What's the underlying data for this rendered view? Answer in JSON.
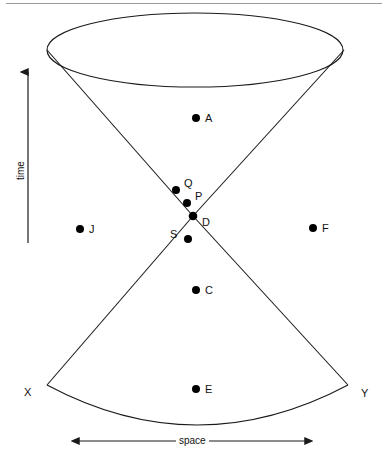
{
  "figure": {
    "background_color": "#ffffff",
    "line_color": "#1a1a1a",
    "dot_color": "#000000",
    "top_rule": true
  },
  "axes": {
    "time": {
      "label": "time",
      "direction": "up",
      "x": 28,
      "y_start": 243,
      "y_end": 70
    },
    "space": {
      "label": "space",
      "direction": "both",
      "y": 441,
      "x_start": 77,
      "x_end": 307
    }
  },
  "cone": {
    "apex": {
      "x": 193,
      "y": 216
    },
    "top_ellipse": {
      "cx": 195,
      "cy": 50,
      "rx": 148,
      "ry": 37
    },
    "bottom_arc": {
      "left_x": 47,
      "right_x": 348,
      "y": 385,
      "sag_y": 425
    },
    "left_top_x": 47,
    "right_top_x": 344
  },
  "corner_labels": [
    {
      "name": "X",
      "text": "X",
      "x": 24,
      "y": 387
    },
    {
      "name": "Y",
      "text": "Y",
      "x": 361,
      "y": 388
    }
  ],
  "events": [
    {
      "name": "A",
      "label": "A",
      "dot_x": 196,
      "dot_y": 118,
      "label_x": 205,
      "label_y": 113,
      "r": 4
    },
    {
      "name": "Q",
      "label": "Q",
      "dot_x": 176,
      "dot_y": 190,
      "label_x": 184,
      "label_y": 178,
      "r": 4
    },
    {
      "name": "P",
      "label": "P",
      "dot_x": 187,
      "dot_y": 203,
      "label_x": 195,
      "label_y": 191,
      "r": 4
    },
    {
      "name": "D",
      "label": "D",
      "dot_x": 193,
      "dot_y": 216,
      "label_x": 202,
      "label_y": 217,
      "r": 4
    },
    {
      "name": "S",
      "label": "S",
      "dot_x": 188,
      "dot_y": 239,
      "label_x": 170,
      "label_y": 229,
      "r": 4
    },
    {
      "name": "C",
      "label": "C",
      "dot_x": 196,
      "dot_y": 290,
      "label_x": 205,
      "label_y": 285,
      "r": 4
    },
    {
      "name": "E",
      "label": "E",
      "dot_x": 196,
      "dot_y": 389,
      "label_x": 205,
      "label_y": 384,
      "r": 4
    },
    {
      "name": "J",
      "label": "J",
      "dot_x": 80,
      "dot_y": 229,
      "label_x": 89,
      "label_y": 224,
      "r": 4
    },
    {
      "name": "F",
      "label": "F",
      "dot_x": 313,
      "dot_y": 228,
      "label_x": 322,
      "label_y": 223,
      "r": 4
    }
  ]
}
